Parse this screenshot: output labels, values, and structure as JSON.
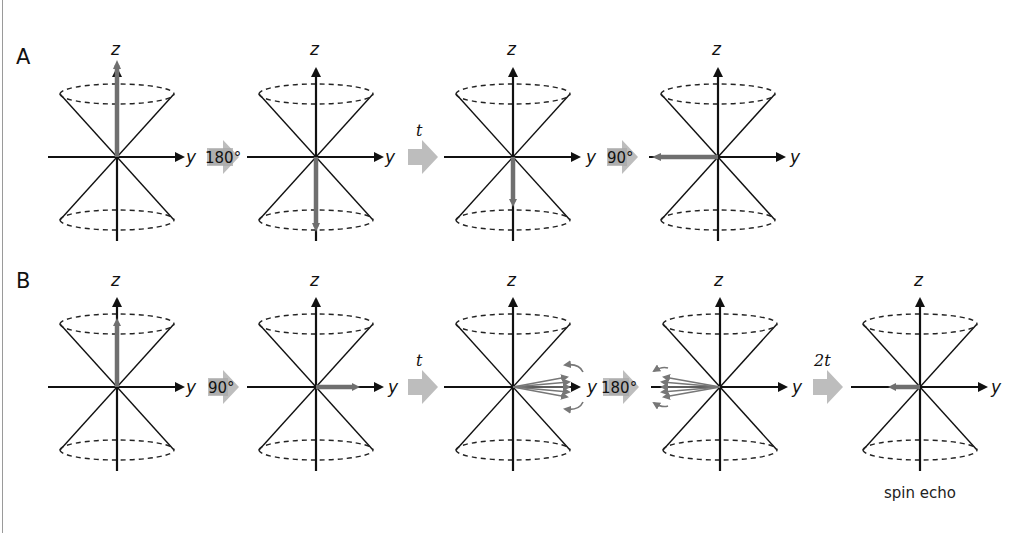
{
  "figure": {
    "panels": [
      {
        "label": "A",
        "diagrams": [
          {
            "center": [
              117,
              157
            ],
            "vector": "up",
            "axis_z": "z",
            "axis_y": "y"
          },
          {
            "center": [
              316,
              157
            ],
            "vector": "down",
            "axis_z": "z",
            "axis_y": "y"
          },
          {
            "center": [
              513,
              157
            ],
            "vector": "down-short",
            "axis_z": "z",
            "axis_y": "y"
          },
          {
            "center": [
              718,
              157
            ],
            "vector": "left",
            "axis_z": "z",
            "axis_y": "y"
          }
        ],
        "steps": [
          {
            "label": "180°",
            "kind": "pulse"
          },
          {
            "label": "t",
            "kind": "delay"
          },
          {
            "label": "90°",
            "kind": "pulse"
          }
        ]
      },
      {
        "label": "B",
        "diagrams": [
          {
            "center": [
              117,
              387
            ],
            "vector": "up",
            "axis_z": "z",
            "axis_y": "y"
          },
          {
            "center": [
              316,
              387
            ],
            "vector": "right",
            "axis_z": "z",
            "axis_y": "y"
          },
          {
            "center": [
              513,
              387
            ],
            "vector": "right-fanned",
            "axis_z": "z",
            "axis_y": "y"
          },
          {
            "center": [
              720,
              387
            ],
            "vector": "left-fanned",
            "axis_z": "z",
            "axis_y": "y"
          },
          {
            "center": [
              920,
              387
            ],
            "vector": "left-refocused",
            "axis_z": "z",
            "axis_y": "y",
            "caption": "spin echo"
          }
        ],
        "steps": [
          {
            "label": "90°",
            "kind": "pulse"
          },
          {
            "label": "t",
            "kind": "delay"
          },
          {
            "label": "180°",
            "kind": "pulse"
          },
          {
            "label": "2t",
            "kind": "delay"
          }
        ]
      }
    ],
    "colors": {
      "axis": "#111111",
      "vector": "#6f6f6f",
      "step_arrow": "#b8b8b8",
      "pulse_label_bg": "#a9a9a9"
    }
  },
  "labels": {
    "panel_a": "A",
    "panel_b": "B",
    "z": "z",
    "y": "y",
    "a_step1": "180°",
    "a_step2": "t",
    "a_step3": "90°",
    "b_step1": "90°",
    "b_step2": "t",
    "b_step3": "180°",
    "b_step4": "2t",
    "caption": "spin echo"
  }
}
